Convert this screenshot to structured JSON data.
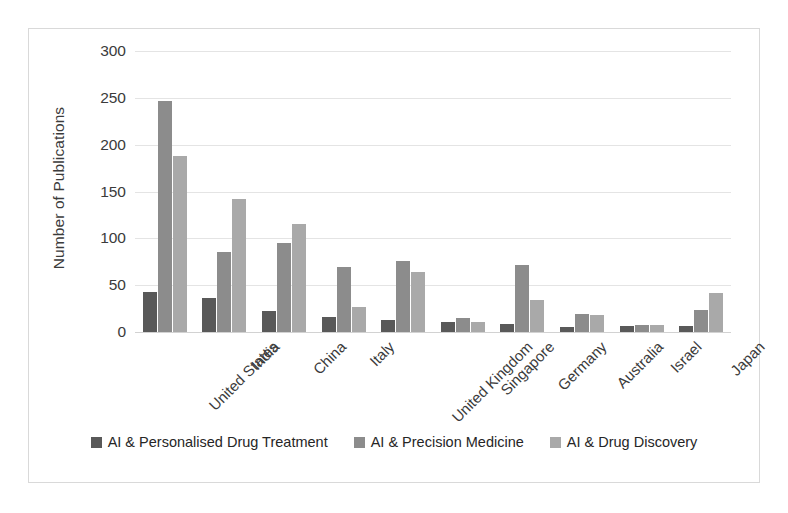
{
  "chart_data": {
    "type": "bar",
    "title": "",
    "xlabel": "",
    "ylabel": "Number of Publications",
    "ylim": [
      0,
      300
    ],
    "yticks": [
      0,
      50,
      100,
      150,
      200,
      250,
      300
    ],
    "grid": true,
    "legend_position": "bottom",
    "categories": [
      "United States",
      "India",
      "China",
      "Italy",
      "United Kingdom",
      "Singapore",
      "Germany",
      "Australia",
      "Israel",
      "Japan"
    ],
    "series": [
      {
        "name": "AI & Personalised Drug Treatment",
        "color": "#595959",
        "values": [
          43,
          36,
          22,
          16,
          13,
          11,
          9,
          5,
          6,
          6
        ]
      },
      {
        "name": "AI & Precision Medicine",
        "color": "#8c8c8c",
        "values": [
          247,
          85,
          95,
          69,
          76,
          15,
          72,
          19,
          8,
          23
        ]
      },
      {
        "name": "AI & Drug Discovery",
        "color": "#a9a9a9",
        "values": [
          188,
          142,
          115,
          27,
          64,
          11,
          34,
          18,
          8,
          42
        ]
      }
    ]
  },
  "frame": {
    "border_color": "#d9d9d9",
    "background": "#ffffff",
    "gridline_color": "#e4e4e4"
  }
}
